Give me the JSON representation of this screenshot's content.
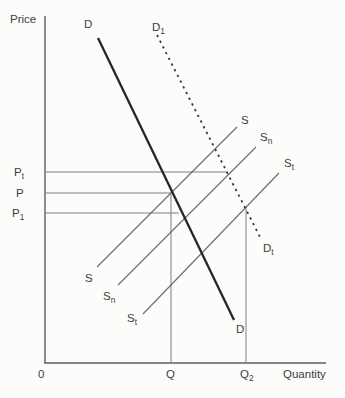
{
  "figure": {
    "background": "#fcfcfa",
    "colors": {
      "axis": "#5f5f5f",
      "demand": "#262626",
      "demand_shifted": "#3a3a3a",
      "supply": "#6a6a6a",
      "guide": "#7e7e7e",
      "text": "#3d3d3d"
    },
    "lines": [
      {
        "name": "y-axis",
        "x1": 45,
        "y1": 16,
        "x2": 45,
        "y2": 363,
        "color": "axis",
        "w": 1.4
      },
      {
        "name": "x-axis",
        "x1": 44.3,
        "y1": 363,
        "x2": 326,
        "y2": 363,
        "color": "axis",
        "w": 1.4
      },
      {
        "name": "price-guide-pt",
        "x1": 45,
        "y1": 172,
        "x2": 228,
        "y2": 172,
        "color": "guide",
        "w": 1
      },
      {
        "name": "price-guide-p",
        "x1": 45,
        "y1": 193,
        "x2": 171,
        "y2": 193,
        "color": "guide",
        "w": 1
      },
      {
        "name": "price-guide-p1",
        "x1": 45,
        "y1": 213,
        "x2": 179,
        "y2": 213,
        "color": "guide",
        "w": 1
      },
      {
        "name": "quantity-guide-q",
        "x1": 171,
        "y1": 193,
        "x2": 171,
        "y2": 363,
        "color": "guide",
        "w": 1
      },
      {
        "name": "quantity-guide-q2",
        "x1": 246,
        "y1": 207,
        "x2": 246,
        "y2": 363,
        "color": "guide",
        "w": 1
      },
      {
        "name": "supply-curve-s",
        "x1": 97,
        "y1": 267,
        "x2": 237,
        "y2": 127,
        "color": "supply",
        "w": 1.1
      },
      {
        "name": "supply-curve-sn",
        "x1": 118,
        "y1": 285,
        "x2": 256,
        "y2": 147,
        "color": "supply",
        "w": 1.1
      },
      {
        "name": "supply-curve-st",
        "x1": 143,
        "y1": 314,
        "x2": 279,
        "y2": 173,
        "color": "supply",
        "w": 1.1
      },
      {
        "name": "demand-curve-d",
        "x1": 98,
        "y1": 38,
        "x2": 234,
        "y2": 320,
        "color": "demand",
        "w": 2.3
      },
      {
        "name": "demand-curve-d1-dotted",
        "x1": 157,
        "y1": 35,
        "x2": 260,
        "y2": 237,
        "color": "demand_shifted",
        "w": 1.8,
        "dash": "2.3 4.1"
      }
    ],
    "labels": [
      {
        "name": "label-price-axis",
        "text": "Price",
        "sub": "",
        "x": 10,
        "y": 23,
        "size": 11.5
      },
      {
        "name": "label-demand-d-top",
        "text": "D",
        "sub": "",
        "x": 84,
        "y": 28,
        "size": 11.5
      },
      {
        "name": "label-demand-d1-top",
        "text": "D",
        "sub": "1",
        "x": 152,
        "y": 31,
        "size": 11.5
      },
      {
        "name": "label-supply-s-top",
        "text": "S",
        "sub": "",
        "x": 241,
        "y": 124,
        "size": 11.5
      },
      {
        "name": "label-supply-sn-top",
        "text": "S",
        "sub": "n",
        "x": 260,
        "y": 141,
        "size": 11.5
      },
      {
        "name": "label-supply-st-top",
        "text": "S",
        "sub": "t",
        "x": 284,
        "y": 167,
        "size": 11.5
      },
      {
        "name": "label-price-pt",
        "text": "P",
        "sub": "t",
        "x": 14,
        "y": 176,
        "size": 11.5
      },
      {
        "name": "label-price-p",
        "text": "P",
        "sub": "",
        "x": 16,
        "y": 197,
        "size": 11.5
      },
      {
        "name": "label-price-p1",
        "text": "P",
        "sub": "1",
        "x": 12,
        "y": 217,
        "size": 11.5
      },
      {
        "name": "label-demand-dt-bottom",
        "text": "D",
        "sub": "t",
        "x": 263,
        "y": 252,
        "size": 11.5
      },
      {
        "name": "label-supply-s-bottom",
        "text": "S",
        "sub": "",
        "x": 85,
        "y": 282,
        "size": 11.5
      },
      {
        "name": "label-supply-sn-bottom",
        "text": "S",
        "sub": "n",
        "x": 103,
        "y": 300,
        "size": 11.5
      },
      {
        "name": "label-supply-st-bottom",
        "text": "S",
        "sub": "t",
        "x": 127,
        "y": 322,
        "size": 11.5
      },
      {
        "name": "label-demand-d-bottom",
        "text": "D",
        "sub": "",
        "x": 236,
        "y": 333,
        "size": 11.5
      },
      {
        "name": "label-origin",
        "text": "0",
        "sub": "",
        "x": 38,
        "y": 378,
        "size": 11.5
      },
      {
        "name": "label-quantity-q",
        "text": "Q",
        "sub": "",
        "x": 166,
        "y": 378,
        "size": 11.5
      },
      {
        "name": "label-quantity-q2",
        "text": "Q",
        "sub": "2",
        "x": 240,
        "y": 378,
        "size": 11.5
      },
      {
        "name": "label-quantity-axis",
        "text": "Quantity",
        "sub": "",
        "x": 283,
        "y": 378,
        "size": 11.5
      }
    ]
  }
}
